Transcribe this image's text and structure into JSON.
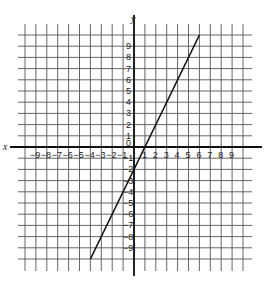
{
  "chart_data": {
    "type": "line",
    "title": "",
    "xlabel": "x",
    "ylabel": "y",
    "xlim": [
      -10,
      10
    ],
    "ylim": [
      -10,
      10
    ],
    "grid": true,
    "x_ticks": [
      "-9",
      "-8",
      "-7",
      "-6",
      "-5",
      "-4",
      "-3",
      "-2",
      "-1",
      "0",
      "1",
      "2",
      "3",
      "4",
      "5",
      "6",
      "7",
      "8",
      "9"
    ],
    "y_ticks": [
      "9",
      "8",
      "7",
      "6",
      "5",
      "4",
      "3",
      "2",
      "1",
      "0",
      "-1",
      "-2",
      "-3",
      "-4",
      "-5",
      "-6",
      "-7",
      "-8",
      "-9"
    ],
    "series": [
      {
        "name": "y = 2x - 2",
        "x": [
          -4,
          6
        ],
        "y": [
          -10,
          10
        ]
      }
    ]
  }
}
